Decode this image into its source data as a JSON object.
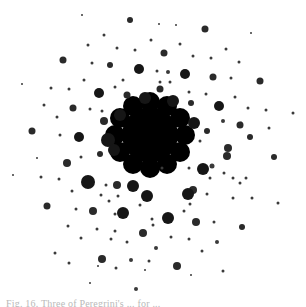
{
  "figure": {
    "background_color": "#ffffff",
    "ink_color": "#1a1a1a",
    "center": {
      "x": 150,
      "y": 135,
      "core_radius": 28
    },
    "core_lobes": [
      [
        150,
        102,
        10
      ],
      [
        167,
        106,
        10
      ],
      [
        180,
        118,
        10
      ],
      [
        185,
        135,
        10
      ],
      [
        180,
        152,
        10
      ],
      [
        167,
        164,
        10
      ],
      [
        150,
        168,
        10
      ],
      [
        133,
        164,
        10
      ],
      [
        120,
        152,
        10
      ],
      [
        115,
        135,
        10
      ],
      [
        120,
        118,
        10
      ],
      [
        133,
        106,
        10
      ]
    ],
    "dots": [
      [
        82,
        15,
        1
      ],
      [
        130,
        20,
        3
      ],
      [
        104,
        35,
        1.5
      ],
      [
        151,
        40,
        1.5
      ],
      [
        88,
        45,
        1.5
      ],
      [
        117,
        48,
        1.5
      ],
      [
        135,
        50,
        1.5
      ],
      [
        63,
        60,
        3.5
      ],
      [
        92,
        63,
        1.5
      ],
      [
        110,
        65,
        3
      ],
      [
        139,
        69,
        5
      ],
      [
        84,
        80,
        1.5
      ],
      [
        123,
        80,
        1.5
      ],
      [
        22,
        84,
        1
      ],
      [
        51,
        88,
        1.5
      ],
      [
        69,
        89,
        1.5
      ],
      [
        99,
        93,
        5
      ],
      [
        127,
        95,
        3.5
      ],
      [
        115,
        87,
        1.5
      ],
      [
        145,
        98,
        6
      ],
      [
        44,
        105,
        1.5
      ],
      [
        73,
        108,
        3.5
      ],
      [
        90,
        109,
        1.5
      ],
      [
        102,
        111,
        1.5
      ],
      [
        120,
        115,
        6
      ],
      [
        57,
        117,
        1.5
      ],
      [
        104,
        121,
        4
      ],
      [
        32,
        131,
        3.5
      ],
      [
        60,
        135,
        1.5
      ],
      [
        79,
        137,
        5
      ],
      [
        108,
        140,
        7
      ],
      [
        159,
        24,
        1
      ],
      [
        176,
        25,
        1
      ],
      [
        205,
        29,
        3.5
      ],
      [
        251,
        33,
        1
      ],
      [
        180,
        44,
        1.5
      ],
      [
        226,
        49,
        1.5
      ],
      [
        164,
        53,
        3.5
      ],
      [
        193,
        56,
        1.5
      ],
      [
        211,
        58,
        1.5
      ],
      [
        239,
        62,
        1.5
      ],
      [
        157,
        71,
        1.5
      ],
      [
        168,
        72,
        2
      ],
      [
        185,
        74,
        5
      ],
      [
        213,
        77,
        3.5
      ],
      [
        231,
        78,
        1.5
      ],
      [
        260,
        81,
        3.5
      ],
      [
        160,
        82,
        1.5
      ],
      [
        170,
        82,
        1.5
      ],
      [
        160,
        89,
        3.5
      ],
      [
        189,
        92,
        1.5
      ],
      [
        206,
        94,
        1.5
      ],
      [
        235,
        97,
        1.5
      ],
      [
        173,
        101,
        6
      ],
      [
        191,
        103,
        3
      ],
      [
        219,
        106,
        5
      ],
      [
        248,
        108,
        1.5
      ],
      [
        266,
        110,
        1.5
      ],
      [
        293,
        113,
        1.5
      ],
      [
        223,
        121,
        2
      ],
      [
        194,
        123,
        6
      ],
      [
        241,
        123,
        1.5
      ],
      [
        240,
        125,
        3.5
      ],
      [
        269,
        128,
        1.5
      ],
      [
        207,
        131,
        3
      ],
      [
        250,
        137,
        3
      ],
      [
        200,
        141,
        1.5
      ],
      [
        228,
        148,
        4
      ],
      [
        37,
        158,
        1
      ],
      [
        67,
        163,
        4
      ],
      [
        81,
        157,
        1.5
      ],
      [
        100,
        154,
        3
      ],
      [
        114,
        150,
        6
      ],
      [
        13,
        175,
        1
      ],
      [
        41,
        177,
        1.5
      ],
      [
        59,
        179,
        1.5
      ],
      [
        88,
        182,
        7
      ],
      [
        106,
        185,
        1.5
      ],
      [
        117,
        185,
        4
      ],
      [
        72,
        191,
        1.5
      ],
      [
        101,
        195,
        1.5
      ],
      [
        118,
        196,
        1.5
      ],
      [
        133,
        186,
        6
      ],
      [
        147,
        196,
        6
      ],
      [
        109,
        201,
        1.5
      ],
      [
        47,
        206,
        3.5
      ],
      [
        76,
        209,
        1.5
      ],
      [
        93,
        211,
        4
      ],
      [
        115,
        214,
        1.5
      ],
      [
        123,
        213,
        6
      ],
      [
        140,
        205,
        1.5
      ],
      [
        152,
        219,
        1.5
      ],
      [
        68,
        226,
        1.5
      ],
      [
        97,
        229,
        1.5
      ],
      [
        115,
        231,
        1.5
      ],
      [
        143,
        233,
        4
      ],
      [
        81,
        238,
        1.5
      ],
      [
        111,
        239,
        1.5
      ],
      [
        127,
        242,
        1.5
      ],
      [
        55,
        253,
        1.5
      ],
      [
        102,
        259,
        4
      ],
      [
        131,
        260,
        2
      ],
      [
        149,
        261,
        1.5
      ],
      [
        69,
        263,
        1.5
      ],
      [
        98,
        266,
        1
      ],
      [
        116,
        268,
        1.5
      ],
      [
        145,
        270,
        1
      ],
      [
        90,
        283,
        1
      ],
      [
        136,
        289,
        2
      ],
      [
        162,
        168,
        1.5
      ],
      [
        189,
        168,
        1.5
      ],
      [
        227,
        156,
        4
      ],
      [
        274,
        157,
        3
      ],
      [
        212,
        166,
        2.5
      ],
      [
        203,
        169,
        6
      ],
      [
        224,
        173,
        1.5
      ],
      [
        210,
        178,
        1.5
      ],
      [
        246,
        178,
        1.5
      ],
      [
        233,
        178,
        1.5
      ],
      [
        240,
        183,
        1.5
      ],
      [
        193,
        190,
        4
      ],
      [
        188,
        194,
        6
      ],
      [
        207,
        194,
        1.5
      ],
      [
        190,
        204,
        1.5
      ],
      [
        184,
        211,
        1.5
      ],
      [
        233,
        198,
        1.5
      ],
      [
        252,
        198,
        1.5
      ],
      [
        278,
        203,
        1.5
      ],
      [
        153,
        225,
        1.5
      ],
      [
        168,
        218,
        6
      ],
      [
        196,
        222,
        4
      ],
      [
        214,
        222,
        1.5
      ],
      [
        242,
        227,
        3
      ],
      [
        171,
        237,
        1.5
      ],
      [
        189,
        239,
        1.5
      ],
      [
        217,
        242,
        2
      ],
      [
        156,
        248,
        2
      ],
      [
        202,
        251,
        1.5
      ],
      [
        177,
        266,
        4
      ],
      [
        223,
        271,
        1.5
      ],
      [
        191,
        275,
        1
      ]
    ]
  },
  "caption": {
    "text": "Fig. 16. Three of Peregrini's ... for ...",
    "color": "#b9b9b9"
  }
}
